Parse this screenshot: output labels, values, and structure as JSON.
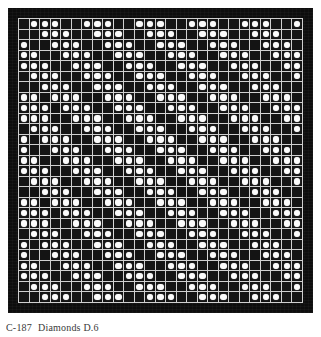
{
  "figure": {
    "caption_number": "C-187",
    "caption_title": "Diamonds D.6",
    "caption_full": "C-187  Diamonds D.6",
    "plate_background": "#0d0d0d",
    "grid_line_color": "#cfcfcf",
    "tile_dark_color": "#141414",
    "dot_color": "#fbfbfb",
    "columns": 27,
    "rows": 27,
    "motif_block_size": 9,
    "motif_repeats_x": 3,
    "motif_repeats_y": 3
  },
  "pattern": {
    "legend": {
      "0": "dark tile, no dot",
      "1": "dark tile with white dot"
    },
    "rows": [
      "011100111001110011100111001",
      "001110011100111001110011100",
      "100111001110011100111001110",
      "110011100111001110011100111",
      "111001110011100111001110011",
      "011100111001110011100111001",
      "001110011100111001110011100",
      "110111001110011100111001110",
      "111011100111001110011100111",
      "111001110011100111001110011",
      "011100111001110011100111001",
      "101110011100111001110011100",
      "100111001110011100111001110",
      "110011100111001110011100111",
      "111001110011100111001110011",
      "011100111001110011100111001",
      "001110011100111001110011100",
      "110111001110011100111001110",
      "111011100111001110011100111",
      "111001110011100111001110011",
      "011100111001110011100111001",
      "101110011100111001110011100",
      "100111001110011100111001110",
      "110011100111001110011100111",
      "111001110011100111001110011",
      "011100111001110011100111001",
      "001110011100111001110011100"
    ]
  }
}
